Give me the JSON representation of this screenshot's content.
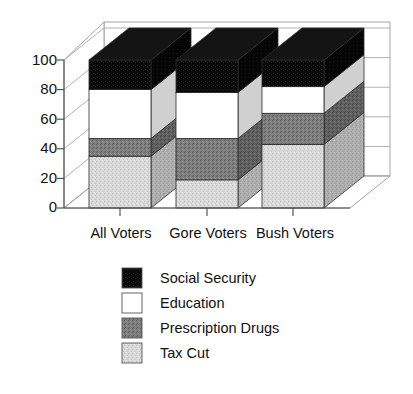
{
  "chart_data": {
    "type": "bar",
    "subtype": "stacked-3d-column",
    "title": "",
    "subtitle": "",
    "xlabel": "",
    "ylabel": "",
    "categories": [
      "All Voters",
      "Gore Voters",
      "Bush Voters"
    ],
    "series": [
      {
        "name": "Tax Cut",
        "values": [
          35,
          19,
          43
        ],
        "color": "#d4d4d4"
      },
      {
        "name": "Prescription Drugs",
        "values": [
          12,
          28,
          21
        ],
        "color": "#7d7d7d"
      },
      {
        "name": "Education",
        "values": [
          33,
          31,
          18
        ],
        "color": "#ffffff"
      },
      {
        "name": "Social Security",
        "values": [
          20,
          22,
          18
        ],
        "color": "#000000"
      }
    ],
    "cumulative_tops": {
      "All Voters": {
        "Tax Cut": 35,
        "Prescription Drugs": 47,
        "Education": 80,
        "Social Security": 100
      },
      "Gore Voters": {
        "Tax Cut": 19,
        "Prescription Drugs": 47,
        "Education": 78,
        "Social Security": 100
      },
      "Bush Voters": {
        "Tax Cut": 43,
        "Prescription Drugs": 64,
        "Education": 82,
        "Social Security": 100
      }
    },
    "ylim": [
      0,
      100
    ],
    "yticks": [
      0,
      20,
      40,
      60,
      80,
      100
    ],
    "ytick_labels": [
      "0",
      "20",
      "40",
      "60",
      "80",
      "100"
    ],
    "grid": true,
    "grid_axis": "y",
    "legend_position": "bottom-center",
    "legend_order": [
      "Social Security",
      "Education",
      "Prescription Drugs",
      "Tax Cut"
    ]
  },
  "legend": {
    "items": [
      {
        "label": "Social Security",
        "swatch": "#0a0a0a"
      },
      {
        "label": "Education",
        "swatch": "#ffffff"
      },
      {
        "label": "Prescription Drugs",
        "swatch": "#7d7d7d"
      },
      {
        "label": "Tax Cut",
        "swatch": "#d4d4d4"
      }
    ]
  },
  "axis": {
    "y_tick_labels": [
      "100",
      "80",
      "60",
      "40",
      "20",
      "0"
    ]
  },
  "categories": {
    "labels": [
      "All Voters",
      "Gore Voters",
      "Bush Voters"
    ]
  },
  "colors": {
    "social_security": "#0a0a0a",
    "education": "#ffffff",
    "prescription_drugs": "#7d7d7d",
    "tax_cut": "#d4d4d4",
    "grid": "#a8a8a8",
    "axis": "#4a4a4a",
    "outline": "#2b2b2b"
  }
}
